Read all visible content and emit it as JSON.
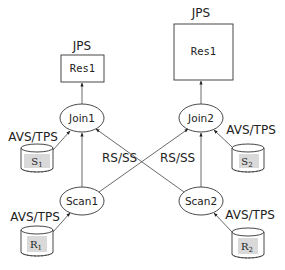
{
  "diagram": {
    "left_plan": {
      "result": {
        "annotation": "JPS",
        "label": "Res1"
      },
      "join": {
        "label": "Join1"
      },
      "inner_table": {
        "annotation": "AVS/TPS",
        "label": "S",
        "subscript": "1"
      },
      "scan": {
        "label": "Scan1"
      },
      "outer_table": {
        "annotation": "AVS/TPS",
        "label": "R",
        "subscript": "1"
      },
      "edge_label": "RS/SS"
    },
    "right_plan": {
      "result": {
        "annotation": "JPS",
        "label": "Res1"
      },
      "join": {
        "label": "Join2"
      },
      "inner_table": {
        "annotation": "AVS/TPS",
        "label": "S",
        "subscript": "2"
      },
      "scan": {
        "label": "Scan2"
      },
      "outer_table": {
        "annotation": "AVS/TPS",
        "label": "R",
        "subscript": "2"
      },
      "edge_label": "RS/SS"
    },
    "colors": {
      "line": "#333333",
      "table_fill": "#d9d9d9",
      "background": "#ffffff"
    }
  }
}
